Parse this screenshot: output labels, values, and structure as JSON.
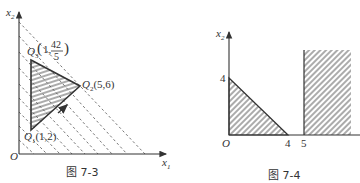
{
  "figures": [
    {
      "id": "fig-7-3",
      "caption": "图 7-3",
      "axes": {
        "x_label": "x",
        "x_sub": "1",
        "y_label": "x",
        "y_sub": "2",
        "origin": "O"
      },
      "points": [
        {
          "name": "Q",
          "sub": "1",
          "coord": "(1,2)"
        },
        {
          "name": "Q",
          "sub": "2",
          "coord": "(5,6)"
        },
        {
          "name": "Q",
          "sub": "3",
          "coord_prefix": "(1,",
          "frac_num": "42",
          "frac_den": "5",
          "coord_suffix": ")"
        }
      ],
      "region": "shaded triangle Q1 Q2 Q3 with horizontal hatching",
      "level_lines": "dashed parallel lines with slope -1, arrow pointing toward increasing objective"
    },
    {
      "id": "fig-7-4",
      "caption": "图 7-4",
      "axes": {
        "y_label": "x",
        "y_sub": "2",
        "origin": "O"
      },
      "ticks": {
        "y": [
          "4"
        ],
        "x": [
          "4",
          "5"
        ]
      },
      "regions": [
        "hatched triangle with vertices (0,0), (4,0), (0,4)",
        "hatched half-strip x1 >= 5"
      ]
    }
  ],
  "colors": {
    "line": "#333333",
    "hatch": "#444444",
    "dash": "#555555"
  }
}
